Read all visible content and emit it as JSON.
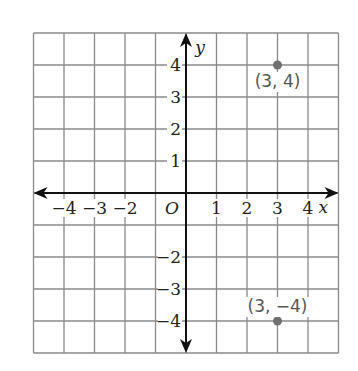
{
  "chart_data": {
    "type": "scatter",
    "title": "",
    "xlabel": "x",
    "ylabel": "y",
    "origin_label": "O",
    "xlim": [
      -5,
      5
    ],
    "ylim": [
      -5,
      5
    ],
    "grid": true,
    "x_ticks": [
      -4,
      -3,
      -2,
      1,
      2,
      3,
      4
    ],
    "y_ticks": [
      4,
      3,
      2,
      1,
      -2,
      -3,
      -4
    ],
    "x_tick_labels": [
      "−4",
      "−3",
      "−2",
      "1",
      "2",
      "3",
      "4"
    ],
    "y_tick_labels": [
      "4",
      "3",
      "2",
      "1",
      "−2",
      "−3",
      "−4"
    ],
    "points": [
      {
        "x": 3,
        "y": 4,
        "label": "(3, 4)"
      },
      {
        "x": 3,
        "y": -4,
        "label": "(3, −4)"
      }
    ],
    "point_color": "#707070",
    "grid_color": "#8a8a8a",
    "axis_color": "#111111"
  }
}
